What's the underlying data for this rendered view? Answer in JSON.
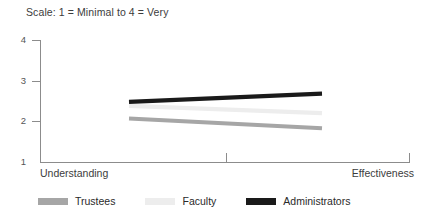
{
  "chart_data": {
    "type": "line",
    "title": "Scale: 1 = Minimal to 4 = Very",
    "xlabel": "",
    "ylabel": "",
    "categories": [
      "Understanding",
      "Effectiveness"
    ],
    "x_tick_labels": [
      "Understanding",
      "Effectiveness"
    ],
    "y_tick_labels": [
      "1",
      "2",
      "3",
      "4"
    ],
    "ylim": [
      1,
      4
    ],
    "grid": false,
    "legend_position": "bottom",
    "series": [
      {
        "name": "Trustees",
        "values": [
          2.07,
          1.83
        ],
        "color": "#a6a6a6"
      },
      {
        "name": "Faculty",
        "values": [
          2.38,
          2.2
        ],
        "color": "#ededed"
      },
      {
        "name": "Administrators",
        "values": [
          2.48,
          2.68
        ],
        "color": "#1a1a1a"
      }
    ]
  },
  "axis": {
    "y_ticks": [
      {
        "label": "4",
        "value": 4
      },
      {
        "label": "3",
        "value": 3
      },
      {
        "label": "2",
        "value": 2
      },
      {
        "label": "1",
        "value": 1
      }
    ],
    "x_left_label": "Understanding",
    "x_right_label": "Effectiveness"
  },
  "legend": {
    "items": [
      {
        "label": "Trustees",
        "color": "#a6a6a6"
      },
      {
        "label": "Faculty",
        "color": "#ededed"
      },
      {
        "label": "Administrators",
        "color": "#1a1a1a"
      }
    ]
  },
  "colors": {
    "axis": "#8c8c8c",
    "text": "#3c3c3c",
    "background": "#ffffff"
  }
}
